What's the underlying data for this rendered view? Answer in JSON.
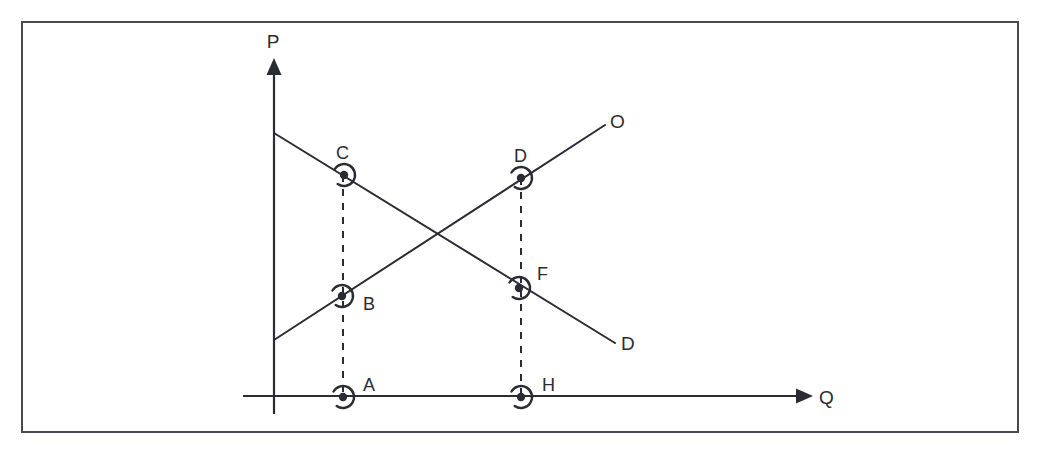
{
  "figure": {
    "frame": {
      "x": 22,
      "y": 22,
      "width": 996,
      "height": 410,
      "stroke": "#4a4a52",
      "stroke_width": 2
    },
    "background_color": "#ffffff",
    "ink_color": "#2b2b33"
  },
  "axes": {
    "vertical": {
      "name": "price-axis",
      "label": "P",
      "label_x": 273,
      "label_y": 48,
      "x": 274,
      "y_top": 58,
      "y_bottom": 414,
      "arrow": "up"
    },
    "horizontal": {
      "name": "quantity-axis",
      "label": "Q",
      "label_x": 819,
      "label_y": 404,
      "y": 396,
      "x_left": 243,
      "x_right": 813,
      "arrow": "right"
    }
  },
  "curves": [
    {
      "name": "demand-curve",
      "label": "D",
      "label_x": 621,
      "label_y": 350,
      "x1": 274,
      "y1": 133,
      "x2": 615,
      "y2": 343,
      "stroke": "#2b2b33",
      "stroke_width": 2
    },
    {
      "name": "supply-curve",
      "label": "O",
      "label_x": 610,
      "label_y": 128,
      "x1": 274,
      "y1": 340,
      "x2": 605,
      "y2": 125,
      "stroke": "#2b2b33",
      "stroke_width": 2
    }
  ],
  "drop_lines": [
    {
      "name": "drop-line-left",
      "x": 343,
      "y_top": 175,
      "y_bottom": 397,
      "dash": "7 7"
    },
    {
      "name": "drop-line-right",
      "x": 521,
      "y_top": 178,
      "y_bottom": 397,
      "dash": "7 7"
    }
  ],
  "points": [
    {
      "id": "C",
      "label": "C",
      "x": 344,
      "y": 175,
      "label_x": 336,
      "label_y": 159,
      "on": "demand-curve"
    },
    {
      "id": "D",
      "label": "D",
      "x": 521,
      "y": 178,
      "label_x": 514,
      "label_y": 162,
      "on": "supply-curve"
    },
    {
      "id": "B",
      "label": "B",
      "x": 342,
      "y": 296,
      "label_x": 363,
      "label_y": 310,
      "on": "supply-curve"
    },
    {
      "id": "F",
      "label": "F",
      "x": 519,
      "y": 288,
      "label_x": 537,
      "label_y": 280,
      "on": "demand-curve"
    },
    {
      "id": "A",
      "label": "A",
      "x": 343,
      "y": 397,
      "label_x": 363,
      "label_y": 391,
      "on": "quantity-axis"
    },
    {
      "id": "H",
      "label": "H",
      "x": 521,
      "y": 397,
      "label_x": 542,
      "label_y": 391,
      "on": "quantity-axis"
    }
  ],
  "marker_style": {
    "dot_radius": 4.2,
    "arc_radius": 11,
    "arc_stroke_width": 2.4,
    "description": "filled dot surrounded by an open circular arc"
  },
  "chart_data": {
    "type": "line",
    "xlabel": "Q",
    "ylabel": "P",
    "grid": false,
    "legend": "none",
    "series": [
      {
        "name": "D",
        "description": "Demand curve, downward sloping",
        "points": [
          [
            0,
            7.4
          ],
          [
            9.7,
            0.75
          ]
        ]
      },
      {
        "name": "O",
        "description": "Supply curve, upward sloping",
        "points": [
          [
            0,
            1.77
          ],
          [
            9.4,
            8.57
          ]
        ]
      }
    ],
    "annotations": [
      {
        "label": "C",
        "x": 1.96,
        "y": 7.0,
        "note": "on demand curve above quantity A"
      },
      {
        "label": "D",
        "x": 7.03,
        "y": 6.91,
        "note": "on supply curve above quantity H"
      },
      {
        "label": "B",
        "x": 1.96,
        "y": 3.17,
        "note": "on supply curve above quantity A"
      },
      {
        "label": "F",
        "x": 7.03,
        "y": 3.43,
        "note": "on demand curve above quantity H"
      },
      {
        "label": "A",
        "x": 1.96,
        "y": 0,
        "note": "quantity on horizontal axis"
      },
      {
        "label": "H",
        "x": 7.03,
        "y": 0,
        "note": "quantity on horizontal axis"
      }
    ],
    "intersection": {
      "x": 4.74,
      "y": 5.11,
      "note": "equilibrium where D and O cross (unlabeled)"
    }
  }
}
